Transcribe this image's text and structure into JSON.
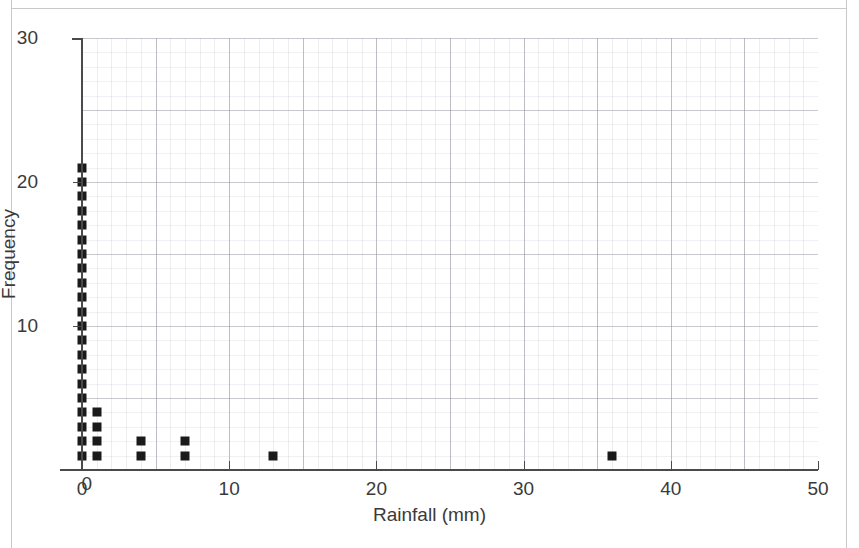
{
  "page": {
    "clipped_top_caption": "",
    "background_color": "#ffffff",
    "frame_color": "#c9c9c9"
  },
  "chart_data": {
    "type": "scatter",
    "title": "",
    "xlabel": "Rainfall (mm)",
    "ylabel": "Frequency",
    "xlim": [
      0,
      50
    ],
    "ylim": [
      0,
      30
    ],
    "xticks": [
      0,
      10,
      20,
      30,
      40,
      50
    ],
    "xtick_labels": [
      "0",
      "10",
      "20",
      "30",
      "40",
      "50"
    ],
    "yticks": [
      0,
      10,
      20,
      30
    ],
    "ytick_labels": [
      "0",
      "10",
      "20",
      "30"
    ],
    "x_minor_step": 1,
    "y_minor_step": 1,
    "grid": true,
    "legend": "none",
    "marker": "square",
    "marker_color": "#1a1a1a",
    "marker_size_px": 9,
    "columns": [
      {
        "x": 0,
        "frequency": 21
      },
      {
        "x": 1,
        "frequency": 4
      },
      {
        "x": 4,
        "frequency": 2
      },
      {
        "x": 7,
        "frequency": 2
      },
      {
        "x": 13,
        "frequency": 1
      },
      {
        "x": 36,
        "frequency": 1
      }
    ],
    "points": [
      {
        "x": 0,
        "y": 1
      },
      {
        "x": 0,
        "y": 2
      },
      {
        "x": 0,
        "y": 3
      },
      {
        "x": 0,
        "y": 4
      },
      {
        "x": 0,
        "y": 5
      },
      {
        "x": 0,
        "y": 6
      },
      {
        "x": 0,
        "y": 7
      },
      {
        "x": 0,
        "y": 8
      },
      {
        "x": 0,
        "y": 9
      },
      {
        "x": 0,
        "y": 10
      },
      {
        "x": 0,
        "y": 11
      },
      {
        "x": 0,
        "y": 12
      },
      {
        "x": 0,
        "y": 13
      },
      {
        "x": 0,
        "y": 14
      },
      {
        "x": 0,
        "y": 15
      },
      {
        "x": 0,
        "y": 16
      },
      {
        "x": 0,
        "y": 17
      },
      {
        "x": 0,
        "y": 18
      },
      {
        "x": 0,
        "y": 19
      },
      {
        "x": 0,
        "y": 20
      },
      {
        "x": 0,
        "y": 21
      },
      {
        "x": 1,
        "y": 1
      },
      {
        "x": 1,
        "y": 2
      },
      {
        "x": 1,
        "y": 3
      },
      {
        "x": 1,
        "y": 4
      },
      {
        "x": 4,
        "y": 1
      },
      {
        "x": 4,
        "y": 2
      },
      {
        "x": 7,
        "y": 1
      },
      {
        "x": 7,
        "y": 2
      },
      {
        "x": 13,
        "y": 1
      },
      {
        "x": 36,
        "y": 1
      }
    ]
  }
}
